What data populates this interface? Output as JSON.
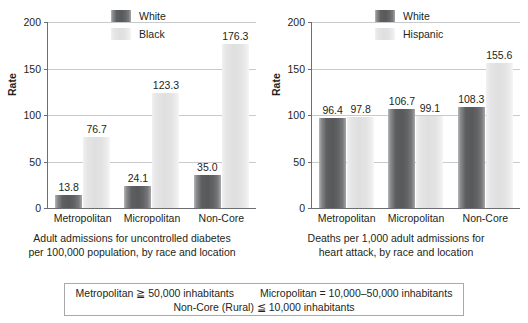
{
  "figure": {
    "panels": [
      {
        "id": "diabetes-admissions",
        "caption_line_1": "Adult admissions for uncontrolled diabetes",
        "caption_line_2": "per 100,000 population, by race and location",
        "chart_data": {
          "type": "bar",
          "title": "",
          "xlabel": "",
          "ylabel": "Rate",
          "ylim": [
            0,
            200
          ],
          "yticks": [
            "0",
            "50",
            "100",
            "150",
            "200"
          ],
          "grid": true,
          "legend_position": "top-center",
          "categories": [
            "Metropolitan",
            "Micropolitan",
            "Non-Core"
          ],
          "series": [
            {
              "name": "White",
              "values": [
                13.8,
                24.1,
                35.0
              ],
              "labels": [
                "13.8",
                "24.1",
                "35.0"
              ],
              "color": "#58595b"
            },
            {
              "name": "Black",
              "values": [
                76.7,
                123.3,
                176.3
              ],
              "labels": [
                "76.7",
                "123.3",
                "176.3"
              ],
              "color": "#e3e3e3"
            }
          ]
        }
      },
      {
        "id": "heart-attack-deaths",
        "caption_line_1": "Deaths per 1,000 adult admissions for",
        "caption_line_2": "heart attack, by race and location",
        "chart_data": {
          "type": "bar",
          "title": "",
          "xlabel": "",
          "ylabel": "Rate",
          "ylim": [
            0,
            200
          ],
          "yticks": [
            "0",
            "50",
            "100",
            "150",
            "200"
          ],
          "grid": true,
          "legend_position": "top-center",
          "categories": [
            "Metropolitan",
            "Micropolitan",
            "Non-Core"
          ],
          "series": [
            {
              "name": "White",
              "values": [
                96.4,
                106.7,
                108.3
              ],
              "labels": [
                "96.4",
                "106.7",
                "108.3"
              ],
              "color": "#58595b"
            },
            {
              "name": "Hispanic",
              "values": [
                97.8,
                99.1,
                155.6
              ],
              "labels": [
                "97.8",
                "99.1",
                "155.6"
              ],
              "color": "#e3e3e3"
            }
          ]
        }
      }
    ]
  },
  "footnote": {
    "metropolitan": "Metropolitan ≧ 50,000 inhabitants",
    "micropolitan": "Micropolitan = 10,000–50,000 inhabitants",
    "noncore": "Non-Core (Rural) ≦ 10,000 inhabitants"
  }
}
